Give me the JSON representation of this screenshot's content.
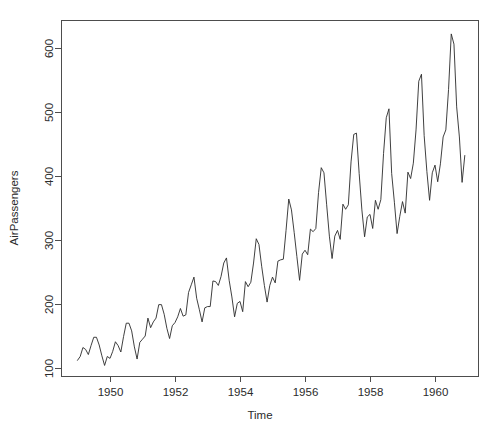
{
  "chart_data": {
    "type": "line",
    "title": "",
    "xlabel": "Time",
    "ylabel": "AirPassengers",
    "xlim": [
      1949.0,
      1961.0
    ],
    "ylim": [
      85,
      640
    ],
    "grid": false,
    "legend": null,
    "box": true,
    "x_ticks": [
      1950,
      1952,
      1954,
      1956,
      1958,
      1960
    ],
    "x_tick_labels": [
      "1950",
      "1952",
      "1954",
      "1956",
      "1958",
      "1960"
    ],
    "y_ticks": [
      100,
      200,
      300,
      400,
      500,
      600
    ],
    "y_tick_labels": [
      "100",
      "200",
      "300",
      "400",
      "500",
      "600"
    ],
    "series": [
      {
        "name": "AirPassengers",
        "color": "#2a2a2a",
        "start_year": 1949,
        "frequency": 12,
        "x": [
          1949.0,
          1949.0833,
          1949.1667,
          1949.25,
          1949.3333,
          1949.4167,
          1949.5,
          1949.5833,
          1949.6667,
          1949.75,
          1949.8333,
          1949.9167,
          1950.0,
          1950.0833,
          1950.1667,
          1950.25,
          1950.3333,
          1950.4167,
          1950.5,
          1950.5833,
          1950.6667,
          1950.75,
          1950.8333,
          1950.9167,
          1951.0,
          1951.0833,
          1951.1667,
          1951.25,
          1951.3333,
          1951.4167,
          1951.5,
          1951.5833,
          1951.6667,
          1951.75,
          1951.8333,
          1951.9167,
          1952.0,
          1952.0833,
          1952.1667,
          1952.25,
          1952.3333,
          1952.4167,
          1952.5,
          1952.5833,
          1952.6667,
          1952.75,
          1952.8333,
          1952.9167,
          1953.0,
          1953.0833,
          1953.1667,
          1953.25,
          1953.3333,
          1953.4167,
          1953.5,
          1953.5833,
          1953.6667,
          1953.75,
          1953.8333,
          1953.9167,
          1954.0,
          1954.0833,
          1954.1667,
          1954.25,
          1954.3333,
          1954.4167,
          1954.5,
          1954.5833,
          1954.6667,
          1954.75,
          1954.8333,
          1954.9167,
          1955.0,
          1955.0833,
          1955.1667,
          1955.25,
          1955.3333,
          1955.4167,
          1955.5,
          1955.5833,
          1955.6667,
          1955.75,
          1955.8333,
          1955.9167,
          1956.0,
          1956.0833,
          1956.1667,
          1956.25,
          1956.3333,
          1956.4167,
          1956.5,
          1956.5833,
          1956.6667,
          1956.75,
          1956.8333,
          1956.9167,
          1957.0,
          1957.0833,
          1957.1667,
          1957.25,
          1957.3333,
          1957.4167,
          1957.5,
          1957.5833,
          1957.6667,
          1957.75,
          1957.8333,
          1957.9167,
          1958.0,
          1958.0833,
          1958.1667,
          1958.25,
          1958.3333,
          1958.4167,
          1958.5,
          1958.5833,
          1958.6667,
          1958.75,
          1958.8333,
          1958.9167,
          1959.0,
          1959.0833,
          1959.1667,
          1959.25,
          1959.3333,
          1959.4167,
          1959.5,
          1959.5833,
          1959.6667,
          1959.75,
          1959.8333,
          1959.9167,
          1960.0,
          1960.0833,
          1960.1667,
          1960.25,
          1960.3333,
          1960.4167,
          1960.5,
          1960.5833,
          1960.6667,
          1960.75,
          1960.8333,
          1960.9167
        ],
        "values": [
          112,
          118,
          132,
          129,
          121,
          135,
          148,
          148,
          136,
          119,
          104,
          118,
          115,
          126,
          141,
          135,
          125,
          149,
          170,
          170,
          158,
          133,
          114,
          140,
          145,
          150,
          178,
          163,
          172,
          178,
          199,
          199,
          184,
          162,
          146,
          166,
          171,
          180,
          193,
          181,
          183,
          218,
          230,
          242,
          209,
          191,
          172,
          194,
          196,
          196,
          236,
          235,
          229,
          243,
          264,
          272,
          237,
          211,
          180,
          201,
          204,
          188,
          235,
          227,
          234,
          264,
          302,
          293,
          259,
          229,
          203,
          229,
          242,
          233,
          267,
          269,
          270,
          315,
          364,
          347,
          312,
          274,
          237,
          278,
          284,
          277,
          317,
          313,
          318,
          374,
          413,
          405,
          355,
          306,
          271,
          306,
          315,
          301,
          356,
          348,
          355,
          422,
          465,
          467,
          404,
          347,
          305,
          336,
          340,
          318,
          362,
          348,
          363,
          435,
          491,
          505,
          404,
          359,
          310,
          337,
          360,
          342,
          406,
          396,
          420,
          472,
          548,
          559,
          463,
          407,
          362,
          405,
          417,
          391,
          419,
          461,
          472,
          535,
          622,
          606,
          508,
          461,
          390,
          432
        ]
      }
    ]
  },
  "plot_geometry": {
    "box_left": 61,
    "box_right": 478,
    "box_top": 20,
    "box_bottom": 376,
    "y_100_px": 368,
    "y_600_px": 48,
    "x_1950_px": 110,
    "x_1960_px": 435,
    "xlabel_x": 260,
    "xlabel_y": 419,
    "ylabel_x": 18,
    "ylabel_y": 208
  },
  "colors": {
    "background": "#ffffff",
    "line": "#2a2a2a",
    "axis": "#4d4d4d",
    "text": "#2b2b2b"
  }
}
